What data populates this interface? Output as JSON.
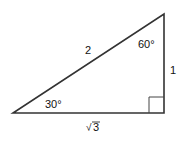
{
  "diagram": {
    "type": "right-triangle",
    "stroke_color": "#333333",
    "vertices": {
      "left": [
        13,
        113
      ],
      "right_angle": [
        164,
        113
      ],
      "top": [
        164,
        14
      ]
    },
    "labels": {
      "hypotenuse": "2",
      "vertical_side": "1",
      "horizontal_side": "3",
      "horizontal_side_prefix": "√",
      "top_angle": "60°",
      "left_angle": "30°"
    },
    "right_angle_marker": true
  }
}
